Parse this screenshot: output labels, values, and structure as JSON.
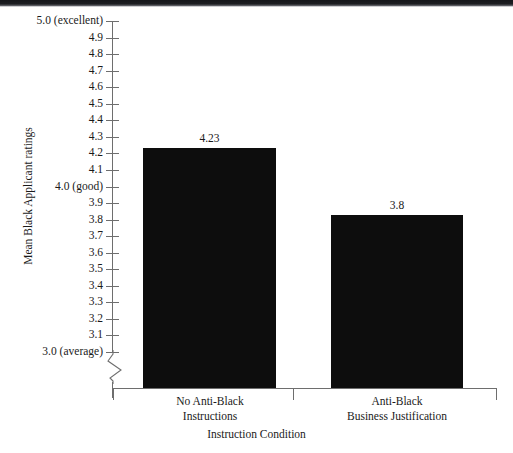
{
  "chart_data": {
    "type": "bar",
    "title": "",
    "xlabel": "Instruction Condition",
    "ylabel": "Mean Black Applicant ratings",
    "categories": [
      "No Anti-Black Instructions",
      "Anti-Black Business Justification"
    ],
    "category_lines": [
      [
        "No Anti-Black",
        "Instructions"
      ],
      [
        "Anti-Black",
        "Business Justification"
      ]
    ],
    "values": [
      4.23,
      3.8
    ],
    "value_labels": [
      "4.23",
      "3.8"
    ],
    "ylim": [
      3.0,
      5.0
    ],
    "axis_break": true,
    "axis_break_below": "3.0",
    "grid": false,
    "legend": false,
    "bar_color": "#0d0d0d",
    "axis_color": "#6e6e6e",
    "yticks": [
      {
        "value": 5.0,
        "label": "5.0 (excellent)"
      },
      {
        "value": 4.9,
        "label": "4.9"
      },
      {
        "value": 4.8,
        "label": "4.8"
      },
      {
        "value": 4.7,
        "label": "4.7"
      },
      {
        "value": 4.6,
        "label": "4.6"
      },
      {
        "value": 4.5,
        "label": "4.5"
      },
      {
        "value": 4.4,
        "label": "4.4"
      },
      {
        "value": 4.3,
        "label": "4.3"
      },
      {
        "value": 4.2,
        "label": "4.2"
      },
      {
        "value": 4.1,
        "label": "4.1"
      },
      {
        "value": 4.0,
        "label": "4.0 (good)"
      },
      {
        "value": 3.9,
        "label": "3.9"
      },
      {
        "value": 3.8,
        "label": "3.8"
      },
      {
        "value": 3.7,
        "label": "3.7"
      },
      {
        "value": 3.6,
        "label": "3.6"
      },
      {
        "value": 3.5,
        "label": "3.5"
      },
      {
        "value": 3.4,
        "label": "3.4"
      },
      {
        "value": 3.3,
        "label": "3.3"
      },
      {
        "value": 3.2,
        "label": "3.2"
      },
      {
        "value": 3.1,
        "label": "3.1"
      },
      {
        "value": 3.0,
        "label": "3.0 (average)"
      }
    ]
  },
  "geometry": {
    "plot_top": 21,
    "plot_bottom": 352,
    "axis_y": 388,
    "bars": [
      {
        "left": 143,
        "right": 276,
        "top": 148
      },
      {
        "left": 331,
        "right": 463,
        "top": 215
      }
    ],
    "x_ticks": [
      113,
      293,
      496
    ],
    "cat_label_centers": [
      210,
      397
    ]
  }
}
